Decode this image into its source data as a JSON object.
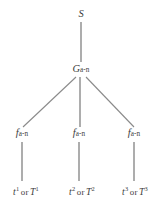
{
  "diagram": {
    "type": "tree",
    "background_color": "#ffffff",
    "line_color": "#8a8a8a",
    "text_color": "#3c3c3c",
    "root": {
      "id": "node-s",
      "label": "S",
      "x": 81,
      "y": 16
    },
    "internal": [
      {
        "id": "node-g",
        "base": "G",
        "subscript": "a-n",
        "label": "G a-n",
        "x": 81,
        "y": 70
      }
    ],
    "branches": [
      {
        "id": "node-f-1",
        "base": "f",
        "subscript": "a-n",
        "label": "f a-n",
        "x": 22,
        "y": 134
      },
      {
        "id": "node-f-2",
        "base": "f",
        "subscript": "a-n",
        "label": "f a-n",
        "x": 79,
        "y": 134
      },
      {
        "id": "node-f-3",
        "base": "f",
        "subscript": "a-n",
        "label": "f a-n",
        "x": 134,
        "y": 134
      }
    ],
    "leaves": [
      {
        "id": "leaf-1",
        "lower_symbol": "t",
        "lower_superscript": "1",
        "conjunction": "or",
        "upper_symbol": "T",
        "upper_superscript": "1",
        "label": "t1 or T1",
        "x": 26,
        "y": 191
      },
      {
        "id": "leaf-2",
        "lower_symbol": "t",
        "lower_superscript": "2",
        "conjunction": "or",
        "upper_symbol": "T",
        "upper_superscript": "2",
        "label": "t2 or T2",
        "x": 82,
        "y": 191
      },
      {
        "id": "leaf-3",
        "lower_symbol": "t",
        "lower_superscript": "3",
        "conjunction": "or",
        "upper_symbol": "T",
        "upper_superscript": "3",
        "label": "t3 or T3",
        "x": 135,
        "y": 191
      }
    ],
    "edges": [
      {
        "id": "edge-s-g",
        "from": "node-s",
        "to": "node-g",
        "x1": 81,
        "y1": 22,
        "x2": 81,
        "y2": 62,
        "kind": "vertical"
      },
      {
        "id": "edge-g-f1",
        "from": "node-g",
        "to": "node-f-1",
        "x1": 76,
        "y1": 76,
        "x2": 23,
        "y2": 127,
        "kind": "diagonal"
      },
      {
        "id": "edge-g-f2",
        "from": "node-g",
        "to": "node-f-2",
        "x1": 80,
        "y1": 76,
        "x2": 80,
        "y2": 127,
        "kind": "vertical"
      },
      {
        "id": "edge-g-f3",
        "from": "node-g",
        "to": "node-f-3",
        "x1": 86,
        "y1": 76,
        "x2": 134,
        "y2": 127,
        "kind": "diagonal"
      },
      {
        "id": "edge-f1-leaf1",
        "from": "node-f-1",
        "to": "leaf-1",
        "x1": 22,
        "y1": 141,
        "x2": 22,
        "y2": 181,
        "kind": "vertical"
      },
      {
        "id": "edge-f2-leaf2",
        "from": "node-f-2",
        "to": "leaf-2",
        "x1": 79,
        "y1": 141,
        "x2": 79,
        "y2": 181,
        "kind": "vertical"
      },
      {
        "id": "edge-f3-leaf3",
        "from": "node-f-3",
        "to": "leaf-3",
        "x1": 134,
        "y1": 141,
        "x2": 134,
        "y2": 181,
        "kind": "vertical"
      }
    ]
  }
}
